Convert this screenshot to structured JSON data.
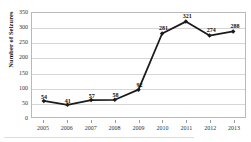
{
  "chart_data": {
    "type": "line",
    "title": "",
    "subtitle": "",
    "xlabel": "",
    "ylabel": "Number of Seizures",
    "categories": [
      "2005",
      "2006",
      "2007",
      "2008",
      "2009",
      "2010",
      "2011",
      "2012",
      "2013"
    ],
    "values": [
      54,
      41,
      57,
      58,
      92,
      281,
      321,
      274,
      288
    ],
    "point_labels": [
      "54",
      "41",
      "57",
      "58",
      "92",
      "281",
      "321",
      "274",
      "288"
    ],
    "series": [
      {
        "name": "Number of Seizures",
        "values": [
          54,
          41,
          57,
          58,
          92,
          281,
          321,
          274,
          288
        ]
      }
    ],
    "ylim": [
      0,
      350
    ],
    "yticks": [
      0,
      50,
      100,
      150,
      200,
      250,
      300,
      350
    ],
    "ytick_labels": [
      "0",
      "50",
      "100",
      "150",
      "200",
      "250",
      "300",
      "350"
    ],
    "xtick_labels": [
      "2005",
      "2006",
      "2007",
      "2008",
      "2009",
      "2010",
      "2011",
      "2012",
      "2013"
    ],
    "grid": true,
    "grid_axis": "y",
    "legend": false,
    "legend_position": "none",
    "marker": "diamond",
    "line_color": "#1b1b1b",
    "marker_color": "#1b1b1b",
    "grid_color": "#d6d6d6",
    "plot_border_color": "#b9b9b9",
    "background_color": "#ffffff"
  }
}
